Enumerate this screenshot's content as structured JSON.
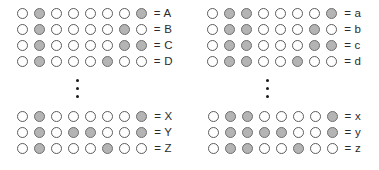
{
  "figure": {
    "circle_count_per_row": 8,
    "filled_color": "#b4b4b4",
    "empty_color": "#ffffff",
    "outline_color": "#5c5c5c",
    "ellipsis_dot_color": "#1a1a1a",
    "ellipsis_dot_count": 3,
    "equals_sign": "=",
    "columns": [
      {
        "name": "uppercase-column",
        "top_group": {
          "rows": [
            {
              "label": "= A",
              "letter": "A",
              "pattern": [
                0,
                1,
                0,
                0,
                0,
                0,
                0,
                1
              ]
            },
            {
              "label": "= B",
              "letter": "B",
              "pattern": [
                0,
                1,
                0,
                0,
                0,
                0,
                1,
                0
              ]
            },
            {
              "label": "= C",
              "letter": "C",
              "pattern": [
                0,
                1,
                0,
                0,
                0,
                0,
                1,
                1
              ]
            },
            {
              "label": "= D",
              "letter": "D",
              "pattern": [
                0,
                1,
                0,
                0,
                0,
                1,
                0,
                0
              ]
            }
          ]
        },
        "bottom_group": {
          "rows": [
            {
              "label": "= X",
              "letter": "X",
              "pattern": [
                0,
                1,
                0,
                0,
                0,
                0,
                0,
                1
              ]
            },
            {
              "label": "= Y",
              "letter": "Y",
              "pattern": [
                0,
                1,
                0,
                1,
                1,
                0,
                0,
                1
              ]
            },
            {
              "label": "= Z",
              "letter": "Z",
              "pattern": [
                0,
                1,
                0,
                0,
                0,
                1,
                0,
                0
              ]
            }
          ]
        }
      },
      {
        "name": "lowercase-column",
        "top_group": {
          "rows": [
            {
              "label": "= a",
              "letter": "a",
              "pattern": [
                0,
                1,
                1,
                0,
                0,
                0,
                0,
                1
              ]
            },
            {
              "label": "= b",
              "letter": "b",
              "pattern": [
                0,
                1,
                1,
                0,
                0,
                0,
                1,
                0
              ]
            },
            {
              "label": "= c",
              "letter": "c",
              "pattern": [
                0,
                1,
                1,
                0,
                0,
                0,
                1,
                1
              ]
            },
            {
              "label": "= d",
              "letter": "d",
              "pattern": [
                0,
                1,
                1,
                0,
                0,
                1,
                0,
                0
              ]
            }
          ]
        },
        "bottom_group": {
          "rows": [
            {
              "label": "= x",
              "letter": "x",
              "pattern": [
                0,
                1,
                1,
                0,
                0,
                0,
                0,
                1
              ]
            },
            {
              "label": "= y",
              "letter": "y",
              "pattern": [
                0,
                1,
                1,
                1,
                1,
                0,
                0,
                1
              ]
            },
            {
              "label": "= z",
              "letter": "z",
              "pattern": [
                0,
                1,
                1,
                0,
                0,
                1,
                0,
                0
              ]
            }
          ]
        }
      }
    ]
  }
}
